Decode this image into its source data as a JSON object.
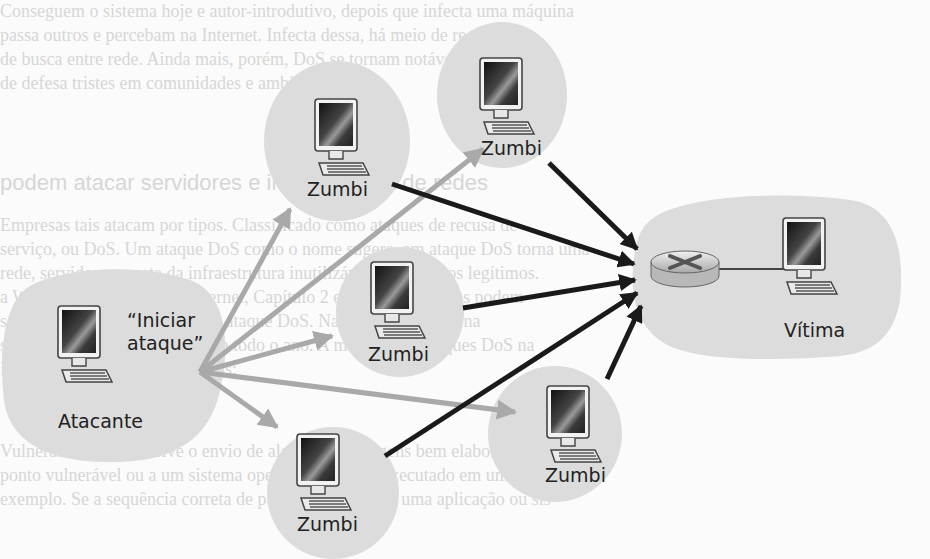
{
  "diagram": {
    "type": "ddos-attack-network",
    "attacker": {
      "label": "Atacante",
      "command": "“Iniciar ataque”",
      "command_line1": "“Iniciar",
      "command_line2": "ataque”"
    },
    "zombies": [
      {
        "id": "z1",
        "label": "Zumbi"
      },
      {
        "id": "z2",
        "label": "Zumbi"
      },
      {
        "id": "z3",
        "label": "Zumbi"
      },
      {
        "id": "z4",
        "label": "Zumbi"
      },
      {
        "id": "z5",
        "label": "Zumbi"
      }
    ],
    "victim": {
      "label": "Vítima",
      "router": "router-icon"
    },
    "edges": {
      "command_edges": {
        "from": "attacker",
        "to": [
          "z1",
          "z2",
          "z3",
          "z4",
          "z5"
        ],
        "color": "#a9a9a9"
      },
      "attack_edges": {
        "from": [
          "z1",
          "z2",
          "z3",
          "z4",
          "z5"
        ],
        "to": "router",
        "color": "#1a1a1a"
      }
    },
    "colors": {
      "cloud": "#dcdcdc",
      "command_arrow": "#a9a9a9",
      "attack_arrow": "#1a1a1a",
      "text": "#222222"
    }
  },
  "background_text": {
    "lines": [
      "Conseguem o sistema hoje e autor-introdutivo, depois que infecta uma máquina",
      "passa outros e percebam na Internet. Infecta dessa, há meio de recursos",
      "de busca entre rede. Ainda mais, porém, DoS se tornam notáveis na internet",
      "de defesa tristes em comunidades e ambientes.",
      "podem atacar servidores e infraestrutura de redes",
      "Empresas tais atacam por tipos. Classificado como ataques de recusa de",
      "serviço, ou DoS. Um ataque DoS como o nome sugere, em ataque DoS torna uma",
      "rede, servidor ou parte da infraestrutura inutilizável por usuários legítimos.",
      "a Web. Servidores DNS e Internet, Capítulo 2 e redes instituições podem",
      "ser alvos de DoS. Chamado de ataque DoS. Na Internet, a visão na",
      "sobre ataques em todo o mundo todo o ano. A maioria dos ataques DoS na",
      "Internet estão em três categorias:",
      "Vulnerabilidade. Envolve o envio de algumas mensagens bem elaboradas a",
      "ponto vulnerável ou a um sistema operacional sendo executado em um hospedeiro",
      "exemplo. Se a sequência correta de pacotes é enviada a uma aplicação ou sis"
    ]
  }
}
